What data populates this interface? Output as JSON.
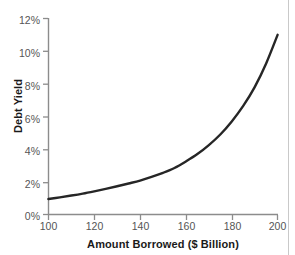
{
  "chart_data": {
    "type": "line",
    "title": "",
    "xlabel": "Amount Borrowed ($ Billion)",
    "ylabel": "Debt Yield",
    "xlim": [
      100,
      200
    ],
    "ylim": [
      0,
      12
    ],
    "grid": false,
    "legend": "none",
    "xticks": [
      "100",
      "120",
      "140",
      "160",
      "180",
      "200"
    ],
    "xtick_values": [
      100,
      120,
      140,
      160,
      180,
      200
    ],
    "yticks": [
      "0%",
      "2%",
      "4%",
      "6%",
      "8%",
      "10%",
      "12%"
    ],
    "ytick_values": [
      0,
      2,
      4,
      6,
      8,
      10,
      12
    ],
    "series": [
      {
        "name": "Debt Yield",
        "color": "#262626",
        "x": [
          100,
          105,
          110,
          115,
          120,
          125,
          130,
          135,
          140,
          145,
          150,
          155,
          160,
          165,
          170,
          175,
          180,
          185,
          190,
          195,
          200
        ],
        "values": [
          0.95,
          1.05,
          1.16,
          1.28,
          1.42,
          1.57,
          1.73,
          1.9,
          2.08,
          2.3,
          2.55,
          2.85,
          3.25,
          3.7,
          4.25,
          4.9,
          5.7,
          6.65,
          7.8,
          9.25,
          11.0
        ]
      }
    ]
  },
  "axes": {
    "axis_color": "#8c8c8c",
    "tick_label_color": "#555555",
    "axis_title_color": "#1a1a1a"
  },
  "page": {
    "background": "#ffffff",
    "border_color": "#c9c9c9"
  }
}
